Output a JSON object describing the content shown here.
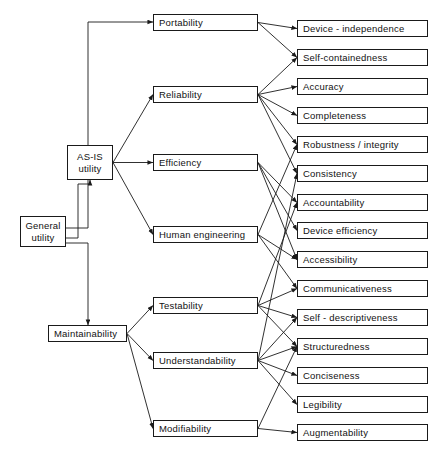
{
  "diagram": {
    "stroke_color": "#1a1a1a",
    "background_color": "#ffffff",
    "levels": {
      "root_label": "level-0-root",
      "intermediate_label": "level-1-intermediate",
      "factors_label": "level-2-factors",
      "criteria_label": "level-3-criteria"
    },
    "root": {
      "id": "general-utility",
      "line1": "General",
      "line2": "utility",
      "x": 20,
      "y": 216,
      "w": 46,
      "h": 31
    },
    "intermediates": [
      {
        "id": "as-is-utility",
        "line1": "AS-IS",
        "line2": "utility",
        "x": 67,
        "y": 145,
        "w": 46,
        "h": 35
      },
      {
        "id": "maintainability",
        "label": "Maintainability",
        "x": 48,
        "y": 325,
        "w": 79,
        "h": 17
      }
    ],
    "factors": [
      {
        "id": "portability",
        "label": "Portability",
        "x": 153,
        "y": 14,
        "w": 105,
        "h": 17
      },
      {
        "id": "reliability",
        "label": "Reliability",
        "x": 153,
        "y": 86,
        "w": 105,
        "h": 17
      },
      {
        "id": "efficiency",
        "label": "Efficiency",
        "x": 153,
        "y": 154,
        "w": 105,
        "h": 17
      },
      {
        "id": "human-engineering",
        "label": "Human  engineering",
        "x": 153,
        "y": 226,
        "w": 105,
        "h": 17
      },
      {
        "id": "testability",
        "label": "Testability",
        "x": 153,
        "y": 297,
        "w": 105,
        "h": 17
      },
      {
        "id": "understandability",
        "label": "Understandability",
        "x": 153,
        "y": 352,
        "w": 105,
        "h": 17
      },
      {
        "id": "modifiability",
        "label": "Modifiability",
        "x": 153,
        "y": 420,
        "w": 105,
        "h": 17
      }
    ],
    "criteria": [
      {
        "id": "device-independence",
        "label": "Device - independence",
        "x": 297,
        "y": 20,
        "w": 131,
        "h": 17
      },
      {
        "id": "self-containedness",
        "label": "Self-containedness",
        "x": 297,
        "y": 49,
        "w": 131,
        "h": 17
      },
      {
        "id": "accuracy",
        "label": "Accuracy",
        "x": 297,
        "y": 78,
        "w": 131,
        "h": 17
      },
      {
        "id": "completeness",
        "label": "Completeness",
        "x": 297,
        "y": 107,
        "w": 131,
        "h": 17
      },
      {
        "id": "robustness-integrity",
        "label": "Robustness / integrity",
        "x": 297,
        "y": 136,
        "w": 131,
        "h": 17
      },
      {
        "id": "consistency",
        "label": "Consistency",
        "x": 297,
        "y": 165,
        "w": 131,
        "h": 17
      },
      {
        "id": "accountability",
        "label": "Accountability",
        "x": 297,
        "y": 194,
        "w": 131,
        "h": 17
      },
      {
        "id": "device-efficiency",
        "label": "Device  efficiency",
        "x": 297,
        "y": 222,
        "w": 131,
        "h": 17
      },
      {
        "id": "accessibility",
        "label": "Accessibility",
        "x": 297,
        "y": 251,
        "w": 131,
        "h": 17
      },
      {
        "id": "communicativeness",
        "label": "Communicativeness",
        "x": 297,
        "y": 280,
        "w": 131,
        "h": 17
      },
      {
        "id": "self-descriptiveness",
        "label": "Self - descriptiveness",
        "x": 297,
        "y": 309,
        "w": 131,
        "h": 17
      },
      {
        "id": "structuredness",
        "label": "Structuredness",
        "x": 297,
        "y": 338,
        "w": 131,
        "h": 17
      },
      {
        "id": "conciseness",
        "label": "Conciseness",
        "x": 297,
        "y": 367,
        "w": 131,
        "h": 17
      },
      {
        "id": "legibility",
        "label": "Legibility",
        "x": 297,
        "y": 396,
        "w": 131,
        "h": 17
      },
      {
        "id": "augmentability",
        "label": "Augmentability",
        "x": 297,
        "y": 424,
        "w": 131,
        "h": 17
      }
    ],
    "edges": [
      {
        "from": "general-utility",
        "to": "portability",
        "style": "orthogonal"
      },
      {
        "from": "general-utility",
        "to": "as-is-utility",
        "style": "orthogonal"
      },
      {
        "from": "general-utility",
        "to": "maintainability",
        "style": "orthogonal"
      },
      {
        "from": "as-is-utility",
        "to": "reliability",
        "style": "straight"
      },
      {
        "from": "as-is-utility",
        "to": "efficiency",
        "style": "straight"
      },
      {
        "from": "as-is-utility",
        "to": "human-engineering",
        "style": "straight"
      },
      {
        "from": "maintainability",
        "to": "testability",
        "style": "straight"
      },
      {
        "from": "maintainability",
        "to": "understandability",
        "style": "straight"
      },
      {
        "from": "maintainability",
        "to": "modifiability",
        "style": "straight"
      },
      {
        "from": "portability",
        "to": "device-independence",
        "style": "straight"
      },
      {
        "from": "portability",
        "to": "self-containedness",
        "style": "straight"
      },
      {
        "from": "reliability",
        "to": "self-containedness",
        "style": "straight"
      },
      {
        "from": "reliability",
        "to": "accuracy",
        "style": "straight"
      },
      {
        "from": "reliability",
        "to": "completeness",
        "style": "straight"
      },
      {
        "from": "reliability",
        "to": "robustness-integrity",
        "style": "straight"
      },
      {
        "from": "reliability",
        "to": "consistency",
        "style": "straight"
      },
      {
        "from": "efficiency",
        "to": "accountability",
        "style": "straight"
      },
      {
        "from": "efficiency",
        "to": "device-efficiency",
        "style": "straight"
      },
      {
        "from": "efficiency",
        "to": "accessibility",
        "style": "straight"
      },
      {
        "from": "human-engineering",
        "to": "robustness-integrity",
        "style": "straight"
      },
      {
        "from": "human-engineering",
        "to": "accessibility",
        "style": "straight"
      },
      {
        "from": "human-engineering",
        "to": "communicativeness",
        "style": "straight"
      },
      {
        "from": "testability",
        "to": "accountability",
        "style": "straight"
      },
      {
        "from": "testability",
        "to": "communicativeness",
        "style": "straight"
      },
      {
        "from": "testability",
        "to": "self-descriptiveness",
        "style": "straight"
      },
      {
        "from": "testability",
        "to": "structuredness",
        "style": "straight"
      },
      {
        "from": "understandability",
        "to": "consistency",
        "style": "straight"
      },
      {
        "from": "understandability",
        "to": "self-descriptiveness",
        "style": "straight"
      },
      {
        "from": "understandability",
        "to": "structuredness",
        "style": "straight"
      },
      {
        "from": "understandability",
        "to": "conciseness",
        "style": "straight"
      },
      {
        "from": "understandability",
        "to": "legibility",
        "style": "straight"
      },
      {
        "from": "modifiability",
        "to": "structuredness",
        "style": "straight"
      },
      {
        "from": "modifiability",
        "to": "augmentability",
        "style": "straight"
      }
    ]
  }
}
